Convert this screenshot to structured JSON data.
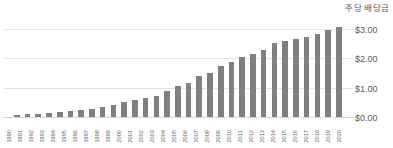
{
  "chart_data": {
    "type": "bar",
    "title": "주당 배당금",
    "xlabel": "",
    "ylabel": "",
    "ylim": [
      0,
      3.2
    ],
    "grid": true,
    "legend": null,
    "y_ticks": [
      "$0.00",
      "$1.00",
      "$2.00",
      "$3.00"
    ],
    "y_tick_values": [
      0,
      1,
      2,
      3
    ],
    "bar_color": "#808080",
    "gridline_color": "#e4e4e4",
    "categories": [
      "1990",
      "1991",
      "1992",
      "1993",
      "1994",
      "1995",
      "1996",
      "1997",
      "1998",
      "1999",
      "2000",
      "2001",
      "2002",
      "2003",
      "2004",
      "2005",
      "2006",
      "2007",
      "2008",
      "2009",
      "2010",
      "2011",
      "2012",
      "2013",
      "2014",
      "2015",
      "2016",
      "2017",
      "2018",
      "2019",
      "2020"
    ],
    "values": [
      0.11,
      0.13,
      0.15,
      0.16,
      0.19,
      0.24,
      0.28,
      0.32,
      0.38,
      0.44,
      0.55,
      0.62,
      0.67,
      0.75,
      0.92,
      1.08,
      1.18,
      1.45,
      1.55,
      1.79,
      1.91,
      2.09,
      2.19,
      2.32,
      2.55,
      2.63,
      2.7,
      2.76,
      2.88,
      3.0,
      3.12
    ]
  }
}
